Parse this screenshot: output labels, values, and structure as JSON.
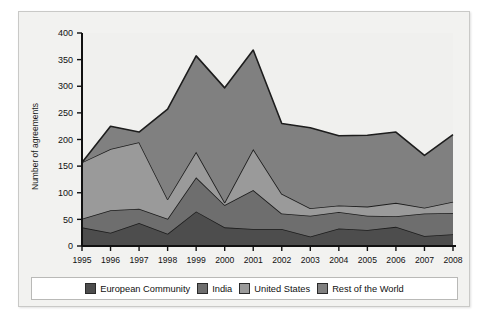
{
  "figure": {
    "background": "#f2f2f0",
    "border_color": "#c9c9c7",
    "plot_background": "#f0f0ee"
  },
  "chart_data": {
    "type": "area",
    "stacked": true,
    "title": "",
    "xlabel": "",
    "ylabel": "Number of agreements",
    "ylim": [
      0,
      400
    ],
    "ytick_step": 50,
    "grid": false,
    "legend_position": "bottom",
    "categories": [
      "1995",
      "1996",
      "1997",
      "1998",
      "1999",
      "2000",
      "2001",
      "2002",
      "2003",
      "2004",
      "2005",
      "2006",
      "2007",
      "2008"
    ],
    "x": [
      1995,
      1996,
      1997,
      1998,
      1999,
      2000,
      2001,
      2002,
      2003,
      2004,
      2005,
      2006,
      2007,
      2008
    ],
    "series": [
      {
        "name": "European Community",
        "color": "#4d4d4d",
        "values": [
          35,
          25,
          43,
          23,
          65,
          35,
          32,
          32,
          18,
          33,
          30,
          36,
          19,
          22
        ]
      },
      {
        "name": "India",
        "color": "#6e6e6e",
        "values": [
          16,
          42,
          27,
          28,
          64,
          42,
          73,
          29,
          39,
          31,
          27,
          20,
          42,
          40
        ]
      },
      {
        "name": "United States",
        "color": "#9a9a9a",
        "values": [
          106,
          115,
          125,
          37,
          48,
          5,
          77,
          37,
          14,
          12,
          17,
          25,
          11,
          21
        ]
      },
      {
        "name": "Rest of the World",
        "color": "#808080",
        "values": [
          0,
          43,
          19,
          169,
          180,
          215,
          186,
          132,
          151,
          131,
          134,
          133,
          98,
          126
        ]
      }
    ],
    "totals": [
      157,
      225,
      214,
      257,
      357,
      297,
      368,
      230,
      222,
      207,
      208,
      214,
      170,
      209
    ],
    "ytick_labels": [
      "0",
      "50",
      "100",
      "150",
      "200",
      "250",
      "300",
      "350",
      "400"
    ]
  },
  "legend": {
    "items": [
      {
        "label": "European Community",
        "color": "#4d4d4d"
      },
      {
        "label": "India",
        "color": "#6e6e6e"
      },
      {
        "label": "United States",
        "color": "#9a9a9a"
      },
      {
        "label": "Rest of the World",
        "color": "#808080"
      }
    ]
  }
}
